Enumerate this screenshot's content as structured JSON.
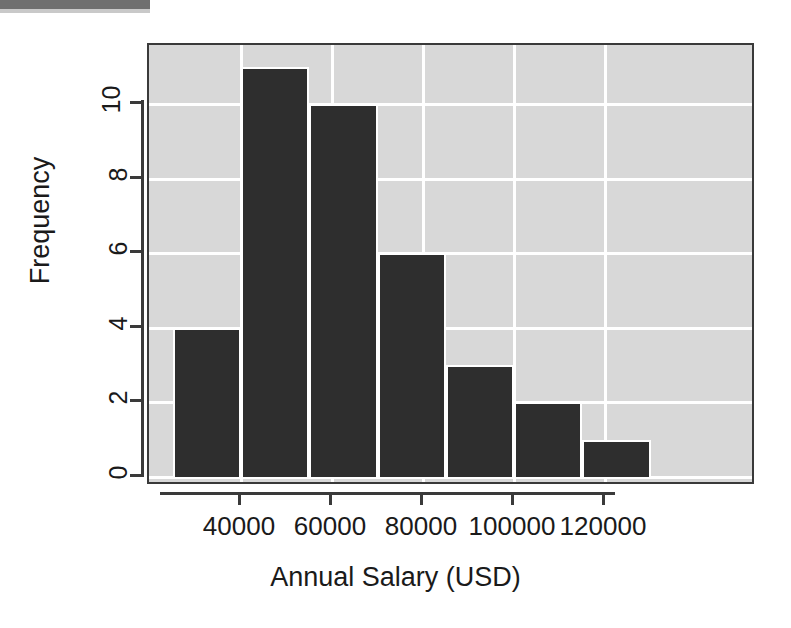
{
  "chart_data": {
    "type": "bar",
    "chart_kind": "histogram",
    "title": "",
    "xlabel": "Annual Salary (USD)",
    "ylabel": "Frequency",
    "categories": [
      "25000-40000",
      "40000-55000",
      "55000-70000",
      "70000-85000",
      "85000-100000",
      "100000-115000",
      "115000-130000"
    ],
    "bin_edges": [
      25000,
      40000,
      55000,
      70000,
      85000,
      100000,
      115000,
      130000
    ],
    "bin_width": 15000,
    "values": [
      4,
      11,
      10,
      6,
      3,
      2,
      1
    ],
    "xlim": [
      25000,
      130000
    ],
    "ylim": [
      0,
      11
    ],
    "x_ticks": [
      40000,
      60000,
      80000,
      100000,
      120000
    ],
    "x_tick_labels": [
      "40000",
      "60000",
      "80000",
      "100000",
      "120000"
    ],
    "y_ticks": [
      0,
      2,
      4,
      6,
      8,
      10
    ],
    "y_tick_labels": [
      "0",
      "2",
      "4",
      "6",
      "8",
      "10"
    ],
    "grid": true,
    "legend": "none",
    "colors": {
      "bar_fill": "#2e2e2e",
      "plot_background": "#d8d8d8",
      "gridline": "#ffffff",
      "axis": "#3a3a3a",
      "text": "#1a1a1a",
      "page_background": "#ffffff"
    }
  },
  "axes": {
    "y_title": "Frequency",
    "x_title": "Annual Salary (USD)"
  }
}
